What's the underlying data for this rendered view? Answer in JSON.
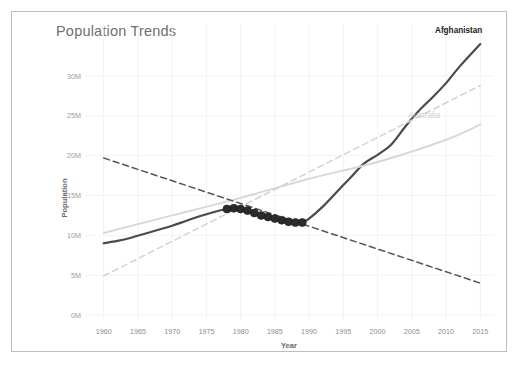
{
  "card": {
    "title": "Population Trends",
    "border_color": "#bdbdbd",
    "background": "#ffffff"
  },
  "chart_data": {
    "type": "line",
    "title": "Population Trends",
    "xlabel": "Year",
    "ylabel": "Population",
    "xlim": [
      1958,
      2017
    ],
    "ylim": [
      0,
      32
    ],
    "grid": true,
    "legend_position": "inline-at-line-end",
    "x_ticks": [
      1960,
      1965,
      1970,
      1975,
      1980,
      1985,
      1990,
      1995,
      2000,
      2005,
      2010,
      2015
    ],
    "x_tick_labels": [
      "1960",
      "1965",
      "1970",
      "1975",
      "1980",
      "1985",
      "1990",
      "1995",
      "2000",
      "2005",
      "2010",
      "2015"
    ],
    "y_ticks": [
      0,
      5,
      10,
      15,
      20,
      25,
      30
    ],
    "y_tick_labels": [
      "0M",
      "5M",
      "10M",
      "15M",
      "20M",
      "25M",
      "30M"
    ],
    "y_unit": "millions",
    "series": [
      {
        "name": "Afghanistan",
        "label": "Afghanistan",
        "color": "#4a4a4a",
        "style": "solid",
        "width": 2.2,
        "labeled_at_end": true,
        "label_color": "#1c1c1c",
        "x": [
          1960,
          1962,
          1964,
          1966,
          1968,
          1970,
          1972,
          1974,
          1976,
          1978,
          1979,
          1980,
          1981,
          1982,
          1983,
          1984,
          1985,
          1986,
          1987,
          1988,
          1989,
          1990,
          1992,
          1994,
          1996,
          1998,
          2000,
          2002,
          2004,
          2006,
          2008,
          2010,
          2012,
          2015
        ],
        "values": [
          9.0,
          9.3,
          9.7,
          10.2,
          10.7,
          11.2,
          11.8,
          12.4,
          12.9,
          13.3,
          13.4,
          13.3,
          13.1,
          12.8,
          12.5,
          12.3,
          12.1,
          11.9,
          11.7,
          11.6,
          11.6,
          12.1,
          13.6,
          15.4,
          17.2,
          19.0,
          20.1,
          21.4,
          23.6,
          25.6,
          27.3,
          29.1,
          31.2,
          34.0
        ]
      },
      {
        "name": "Afghanistan markers",
        "marker_series": true,
        "color": "#2b2b2b",
        "marker": "circle",
        "marker_radius": 4,
        "x": [
          1978,
          1979,
          1980,
          1981,
          1982,
          1983,
          1984,
          1985,
          1986,
          1987,
          1988,
          1989
        ],
        "values": [
          13.3,
          13.4,
          13.3,
          13.1,
          12.8,
          12.5,
          12.3,
          12.1,
          11.9,
          11.7,
          11.6,
          11.6
        ]
      },
      {
        "name": "Australia",
        "label": "Australia",
        "color": "#d8d8d8",
        "style": "solid",
        "width": 2.0,
        "labeled_at_end": true,
        "label_color": "#cfcfcf",
        "x": [
          1960,
          1970,
          1980,
          1990,
          2000,
          2010,
          2015
        ],
        "values": [
          10.3,
          12.5,
          14.7,
          17.1,
          19.2,
          22.0,
          23.9
        ]
      },
      {
        "name": "Afghanistan trend",
        "trend_line": true,
        "color": "#555555",
        "style": "dashed",
        "width": 1.5,
        "x": [
          1960,
          2015
        ],
        "values": [
          19.7,
          4.0
        ]
      },
      {
        "name": "Australia trend",
        "trend_line": true,
        "color": "#d2d2d2",
        "style": "dashed",
        "width": 1.5,
        "x": [
          1960,
          2015
        ],
        "values": [
          4.9,
          28.8
        ]
      }
    ]
  }
}
